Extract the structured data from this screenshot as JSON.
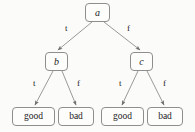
{
  "diagram": {
    "type": "decision-tree",
    "title": "",
    "colors": {
      "background": "#fbfbfa",
      "node_border": "#8e8e8e",
      "node_fill": "#fdfdfc",
      "edge": "#8e8e8e",
      "text": "#1c1c1c"
    },
    "nodes": [
      {
        "id": "a",
        "label": "a",
        "kind": "variable",
        "x": 85,
        "y": 3,
        "w": 25,
        "h": 19
      },
      {
        "id": "b",
        "label": "b",
        "kind": "variable",
        "x": 45,
        "y": 52,
        "w": 23,
        "h": 19
      },
      {
        "id": "c",
        "label": "c",
        "kind": "variable",
        "x": 130,
        "y": 52,
        "w": 23,
        "h": 19
      },
      {
        "id": "leaf1",
        "label": "good",
        "kind": "leaf",
        "x": 12,
        "y": 107,
        "w": 43,
        "h": 19
      },
      {
        "id": "leaf2",
        "label": "bad",
        "kind": "leaf",
        "x": 58,
        "y": 107,
        "w": 36,
        "h": 19
      },
      {
        "id": "leaf3",
        "label": "good",
        "kind": "leaf",
        "x": 101,
        "y": 107,
        "w": 43,
        "h": 19
      },
      {
        "id": "leaf4",
        "label": "bad",
        "kind": "leaf",
        "x": 147,
        "y": 107,
        "w": 36,
        "h": 19
      }
    ],
    "edges": [
      {
        "from": "a",
        "to": "b",
        "label": "t",
        "x1": 92,
        "y1": 22,
        "x2": 58,
        "y2": 50,
        "lx": 65,
        "ly": 24
      },
      {
        "from": "a",
        "to": "c",
        "label": "f",
        "x1": 104,
        "y1": 22,
        "x2": 140,
        "y2": 50,
        "lx": 127,
        "ly": 24
      },
      {
        "from": "b",
        "to": "leaf1",
        "label": "t",
        "x1": 53,
        "y1": 71,
        "x2": 35,
        "y2": 105,
        "lx": 33,
        "ly": 79
      },
      {
        "from": "b",
        "to": "leaf2",
        "label": "f",
        "x1": 62,
        "y1": 71,
        "x2": 76,
        "y2": 105,
        "lx": 77,
        "ly": 79
      },
      {
        "from": "c",
        "to": "leaf3",
        "label": "t",
        "x1": 138,
        "y1": 71,
        "x2": 122,
        "y2": 105,
        "lx": 119,
        "ly": 79
      },
      {
        "from": "c",
        "to": "leaf4",
        "label": "f",
        "x1": 147,
        "y1": 71,
        "x2": 164,
        "y2": 105,
        "lx": 163,
        "ly": 79
      }
    ]
  }
}
